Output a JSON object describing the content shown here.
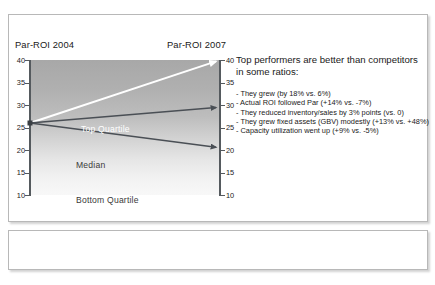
{
  "slide": {
    "chart_title_left": "Par-ROI 2004",
    "chart_title_right": "Par-ROI 2007"
  },
  "panel": {
    "heading": "Top performers are better than competitors in some ratios:",
    "bullets": [
      "- They grew (by 18% vs. 6%)",
      "- Actual ROI followed Par (+14% vs. -7%)",
      "- They reduced inventory/sales by 3% points (vs. 0)",
      "- They grew fixed assets (GBV) modestly (+13% vs. +48%)",
      "- Capacity utilization went up (+9% vs. -5%)"
    ]
  },
  "chart_data": {
    "type": "line",
    "title": "",
    "xlabel": "",
    "ylabel": "Par-ROI",
    "x": [
      "Par-ROI 2004",
      "Par-ROI 2007"
    ],
    "ylim": [
      10,
      40
    ],
    "yticks": [
      40,
      35,
      30,
      25,
      20,
      15,
      10
    ],
    "ytick_labels_left": [
      "40",
      "35",
      "30",
      "25",
      "20",
      "15",
      "10"
    ],
    "ytick_labels_right": [
      "40",
      "35",
      "30",
      "25",
      "20",
      "15",
      "10"
    ],
    "grid": false,
    "legend": "inline-labels",
    "series": [
      {
        "name": "Top Quartile",
        "values": [
          26,
          40
        ],
        "color": "#ffffff"
      },
      {
        "name": "Median",
        "values": [
          26,
          29.5
        ],
        "color": "#4a4f55"
      },
      {
        "name": "Bottom Quartile",
        "values": [
          26,
          20.5
        ],
        "color": "#4a4f55"
      }
    ],
    "annotations": [
      "Top Quartile",
      "Median",
      "Bottom Quartile"
    ],
    "background": "vertical gradient, dark grey at top to near-white at bottom"
  },
  "colors": {
    "frame_border": "#b8b8b8",
    "axis": "#555a5e",
    "line_dark": "#4a4f55",
    "line_light": "#ffffff",
    "text": "#1a1a1a",
    "page_background": "#ffffff"
  }
}
